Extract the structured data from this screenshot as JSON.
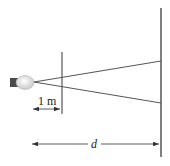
{
  "diagram": {
    "labels": {
      "distance_1m": "1 m",
      "distance_d": "d"
    },
    "elements": {
      "light_source": "light-bulb",
      "aperture": "aperture-screen",
      "wall": "projection-wall"
    },
    "colors": {
      "line": "#555555",
      "bulb_glass": "#dcdcdc",
      "bulb_base": "#555555"
    }
  }
}
